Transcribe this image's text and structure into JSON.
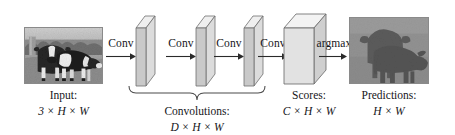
{
  "figure": {
    "background_color": "#ffffff",
    "ink_color": "#16161a"
  },
  "stages": [
    {
      "id": "input",
      "caption_title": "Input:",
      "caption_dims": "3 × H × W",
      "kind": "image",
      "alt": "photograph of two black-and-white cows standing in a grassy field"
    },
    {
      "id": "conv-stack",
      "caption_title": "Convolutions:",
      "caption_dims": "D × H × W",
      "kind": "slab-group",
      "slab_count": 3
    },
    {
      "id": "scores",
      "caption_title": "Scores:",
      "caption_dims": "C × H × W",
      "kind": "box"
    },
    {
      "id": "predictions",
      "caption_title": "Predictions:",
      "caption_dims": "H × W",
      "kind": "image",
      "alt": "segmentation mask showing two dark cow silhouettes on a gray background"
    }
  ],
  "operations": [
    {
      "id": "conv-1",
      "label": "Conv"
    },
    {
      "id": "conv-2",
      "label": "Conv"
    },
    {
      "id": "conv-3",
      "label": "Conv"
    },
    {
      "id": "conv-4",
      "label": "Conv"
    },
    {
      "id": "argmax",
      "label": "argmax"
    }
  ],
  "palette": {
    "slab_front": "#c9c9c9",
    "slab_top": "#efefef",
    "slab_side": "#dcdcdc",
    "box_front": "#e2e2e2",
    "box_top": "#f3f3f3",
    "box_side": "#cfcfcf",
    "outline": "#6e6e6e",
    "brace": "#4a4a4a",
    "arrow": "#2a2a2a",
    "prediction_background": "#8f8f8f",
    "prediction_foreground": "#5c5c5c",
    "photo_sky": "#b9b9b9",
    "photo_grass": "#9a9a9a",
    "photo_cow_dark": "#2e2e2e",
    "photo_cow_light": "#ececec"
  }
}
